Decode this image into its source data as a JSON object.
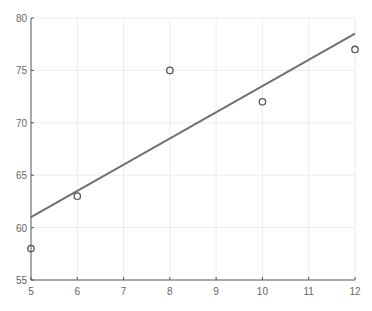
{
  "chart_data": {
    "type": "scatter",
    "title": "",
    "xlabel": "",
    "ylabel": "",
    "xlim": [
      5,
      12
    ],
    "ylim": [
      55,
      80
    ],
    "grid": true,
    "legend": null,
    "x_ticks": [
      5,
      6,
      7,
      8,
      9,
      10,
      11,
      12
    ],
    "y_ticks": [
      55,
      60,
      65,
      70,
      75,
      80
    ],
    "series": [
      {
        "name": "data",
        "type": "scatter",
        "marker": "open-circle",
        "color": "#555555",
        "x": [
          5,
          6,
          8,
          10,
          12
        ],
        "y": [
          58,
          63,
          75,
          72,
          77
        ]
      },
      {
        "name": "fit",
        "type": "line",
        "color": "#707070",
        "x": [
          5,
          12
        ],
        "y": [
          61.0,
          78.5
        ]
      }
    ]
  },
  "colors": {
    "axis": "#555555",
    "grid": "#ececec",
    "line": "#707070",
    "marker": "#555555",
    "tick_label": "#666666"
  }
}
